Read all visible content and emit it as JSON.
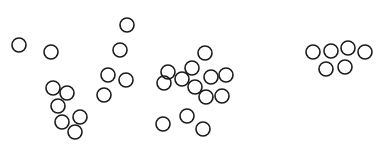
{
  "figure": {
    "width": 387,
    "height": 157,
    "background": "#ffffff",
    "stroke_color": "#1a1a1a",
    "stroke_width": 1.6,
    "radius": 7,
    "clusters": [
      {
        "name": "left-scatter",
        "circles": [
          {
            "x": 19,
            "y": 45
          },
          {
            "x": 51,
            "y": 52
          },
          {
            "x": 53,
            "y": 88
          },
          {
            "x": 67,
            "y": 93
          },
          {
            "x": 58,
            "y": 106
          },
          {
            "x": 62,
            "y": 122
          },
          {
            "x": 80,
            "y": 117
          },
          {
            "x": 75,
            "y": 132
          }
        ]
      },
      {
        "name": "center-left-column",
        "circles": [
          {
            "x": 127,
            "y": 25
          },
          {
            "x": 120,
            "y": 50
          },
          {
            "x": 108,
            "y": 75
          },
          {
            "x": 126,
            "y": 80
          },
          {
            "x": 104,
            "y": 95
          }
        ]
      },
      {
        "name": "center-dense-group",
        "circles": [
          {
            "x": 205,
            "y": 53
          },
          {
            "x": 192,
            "y": 68
          },
          {
            "x": 168,
            "y": 72
          },
          {
            "x": 164,
            "y": 83
          },
          {
            "x": 182,
            "y": 79
          },
          {
            "x": 211,
            "y": 77
          },
          {
            "x": 226,
            "y": 75
          },
          {
            "x": 195,
            "y": 87
          },
          {
            "x": 206,
            "y": 97
          },
          {
            "x": 222,
            "y": 96
          },
          {
            "x": 163,
            "y": 124
          },
          {
            "x": 187,
            "y": 116
          },
          {
            "x": 203,
            "y": 129
          }
        ]
      },
      {
        "name": "right-tight-group",
        "circles": [
          {
            "x": 313,
            "y": 52
          },
          {
            "x": 331,
            "y": 51
          },
          {
            "x": 348,
            "y": 48
          },
          {
            "x": 365,
            "y": 52
          },
          {
            "x": 326,
            "y": 69
          },
          {
            "x": 345,
            "y": 67
          }
        ]
      }
    ]
  }
}
